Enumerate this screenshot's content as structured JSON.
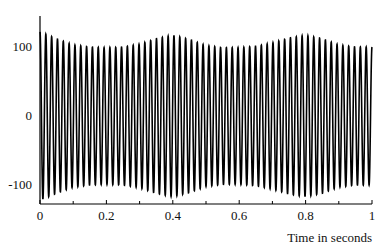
{
  "chart_data": {
    "type": "line",
    "title": "",
    "xlabel": "Time in seconds",
    "ylabel": "",
    "xlim": [
      0,
      1
    ],
    "ylim": [
      -140,
      140
    ],
    "grid": false,
    "legend": "none",
    "x_ticks": [
      {
        "value": 0,
        "label": "0"
      },
      {
        "value": 0.2,
        "label": "0.2"
      },
      {
        "value": 0.4,
        "label": "0.4"
      },
      {
        "value": 0.6,
        "label": "0.6"
      },
      {
        "value": 0.8,
        "label": "0.8"
      },
      {
        "value": 1,
        "label": "1"
      }
    ],
    "x_minor_ticks": [
      0.1,
      0.3,
      0.5,
      0.7,
      0.9
    ],
    "y_ticks": [
      {
        "value": 100,
        "label": "100"
      },
      {
        "value": 0,
        "label": "0"
      },
      {
        "value": -100,
        "label": "-100"
      }
    ],
    "series": [
      {
        "name": "signal",
        "color": "#000000",
        "carrier_frequency_hz": 57,
        "envelope_samples": {
          "t": [
            0,
            0.05,
            0.1,
            0.15,
            0.2,
            0.25,
            0.3,
            0.35,
            0.4,
            0.45,
            0.5,
            0.55,
            0.6,
            0.65,
            0.7,
            0.75,
            0.8,
            0.85,
            0.9,
            0.95,
            1.0
          ],
          "amplitude": [
            122,
            112,
            103,
            100,
            99,
            100,
            104,
            112,
            117,
            111,
            102,
            99,
            99,
            101,
            106,
            113,
            117,
            112,
            103,
            100,
            100
          ]
        }
      }
    ]
  }
}
